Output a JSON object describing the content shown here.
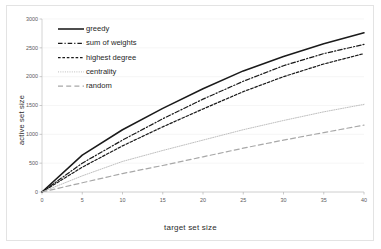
{
  "chart_data": {
    "type": "line",
    "title": "",
    "xlabel": "target set size",
    "ylabel": "active set size",
    "xlim": [
      0,
      40
    ],
    "ylim": [
      0,
      3000
    ],
    "xticks": [
      0,
      5,
      10,
      15,
      20,
      25,
      30,
      35,
      40
    ],
    "yticks": [
      0,
      500,
      1000,
      1500,
      2000,
      2500,
      3000
    ],
    "grid": false,
    "legend_position": "upper-left",
    "x": [
      0,
      5,
      10,
      15,
      20,
      25,
      30,
      35,
      40
    ],
    "series": [
      {
        "name": "greedy",
        "style": "solid",
        "color": "#1a1a1a",
        "values": [
          0,
          640,
          1080,
          1450,
          1790,
          2100,
          2350,
          2570,
          2760
        ]
      },
      {
        "name": "sum of weights",
        "style": "dash-dot",
        "color": "#1a1a1a",
        "values": [
          0,
          500,
          900,
          1270,
          1610,
          1920,
          2190,
          2400,
          2560
        ]
      },
      {
        "name": "highest degree",
        "style": "dashed-short",
        "color": "#1a1a1a",
        "values": [
          0,
          430,
          800,
          1130,
          1440,
          1740,
          2000,
          2220,
          2400
        ]
      },
      {
        "name": "centrality",
        "style": "dotted",
        "color": "#b4b4b4",
        "values": [
          0,
          280,
          530,
          720,
          900,
          1080,
          1240,
          1390,
          1520
        ]
      },
      {
        "name": "random",
        "style": "dashed-long",
        "color": "#a8a8a8",
        "values": [
          0,
          160,
          320,
          460,
          610,
          760,
          900,
          1030,
          1160
        ]
      }
    ]
  },
  "legend": {
    "items": [
      {
        "label": "greedy"
      },
      {
        "label": "sum of weights"
      },
      {
        "label": "highest degree"
      },
      {
        "label": "centrality"
      },
      {
        "label": "random"
      }
    ]
  },
  "axes": {
    "x_title": "target set size",
    "y_title": "active set size",
    "x_tick_labels": [
      "0",
      "5",
      "10",
      "15",
      "20",
      "25",
      "30",
      "35",
      "40"
    ],
    "y_tick_labels": [
      "0",
      "500",
      "1000",
      "1500",
      "2000",
      "2500",
      "3000"
    ]
  }
}
